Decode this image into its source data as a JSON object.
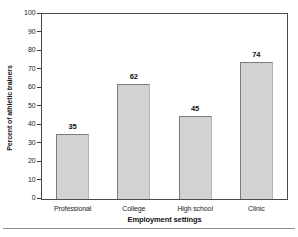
{
  "chart_data": {
    "type": "bar",
    "title": "",
    "xlabel": "Employment settings",
    "ylabel": "Percent of athletic trainers",
    "categories": [
      "Professional",
      "College",
      "High school",
      "Clinic"
    ],
    "values": [
      35,
      62,
      45,
      74
    ],
    "data_labels": [
      "35",
      "62",
      "45",
      "74"
    ],
    "ylim": [
      0,
      100
    ],
    "yticks": [
      0,
      10,
      20,
      30,
      40,
      50,
      60,
      70,
      80,
      90,
      100
    ],
    "ytick_labels": [
      "0",
      "10",
      "20",
      "30",
      "40",
      "50",
      "60",
      "70",
      "80",
      "90",
      "100"
    ],
    "grid": false,
    "legend": null,
    "legend_position": "none",
    "bar_fill_color": "#d2d2d2",
    "bar_edge_color": "#7c7c7c",
    "axis_color": "#4a4a4a",
    "text_color": "#1a1a1a"
  }
}
